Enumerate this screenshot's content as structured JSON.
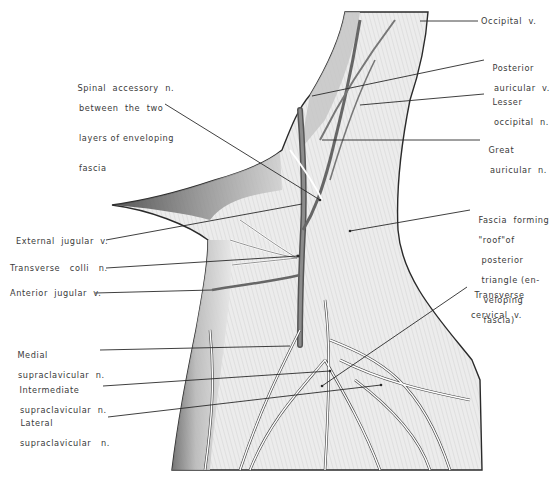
{
  "figure": {
    "colors": {
      "ink": "#2a2a2a",
      "shade_dark": "#4a4a4a",
      "shade_mid": "#9a9a9a",
      "paper": "#ffffff",
      "fascia": "#e6e6e6"
    }
  },
  "labels": {
    "occipital_v": "Occipital  v.",
    "posterior_auricular_v": {
      "line1": "Posterior",
      "line2": "auricular  v."
    },
    "lesser_occipital_n": {
      "line1": "Lesser",
      "line2": "occipital  n."
    },
    "great_auricular_n": {
      "line1": "Great",
      "line2": "auricular  n."
    },
    "fascia_roof": {
      "line1": "Fascia  forming",
      "line2": "\"roof\"of",
      "line3": "posterior",
      "line4": "triangle (en-",
      "line5": "veloping",
      "line6": "fascia)"
    },
    "transverse_cervical_v": {
      "line1": "Transverse",
      "line2": "cervical  v."
    },
    "spinal_accessory_n": {
      "line1": "Spinal  accessory  n.",
      "line2": "between  the  two",
      "line3": "layers of enveloping",
      "line4": "fascia"
    },
    "external_jugular_v": "External  jugular  v.",
    "transverse_colli_n": "Transverse   colli   n.",
    "anterior_jugular_v": "Anterior  jugular  v.",
    "medial_supraclavicular_n": {
      "line1": "Medial",
      "line2": "supraclavicular  n."
    },
    "intermediate_supraclavicular_n": {
      "line1": "Intermediate",
      "line2": "supraclavicular  n."
    },
    "lateral_supraclavicular_n": {
      "line1": "Lateral",
      "line2": "supraclavicular   n."
    }
  }
}
